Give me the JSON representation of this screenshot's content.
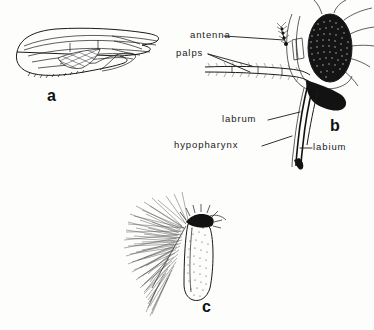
{
  "plate": {
    "title": "Mosquito morphology plate",
    "background_color": "#fdfdfc",
    "ink_color": "#1a1a1a",
    "width": 374,
    "height": 330
  },
  "figures": [
    {
      "id": "a",
      "letter": "a",
      "subject": "mosquito wing",
      "description": "Lateral outline of a mosquito wing showing longitudinal veins, a cross-hatched shaded cell, and a fringed posterior margin."
    },
    {
      "id": "b",
      "letter": "b",
      "subject": "mosquito head in lateral view",
      "description": "Head with large stippled compound eye, segmented antenna, hairy maxillary palps, and the elongated proboscis stylet bundle."
    },
    {
      "id": "c",
      "letter": "c",
      "subject": "plumose antenna segment",
      "description": "Stippled antennal capsule bearing a dense plume of radiating hairs and a spiky crown."
    }
  ],
  "labels": [
    {
      "id": "antenna",
      "text": "antenna"
    },
    {
      "id": "palps",
      "text": "palps"
    },
    {
      "id": "labrum",
      "text": "labrum"
    },
    {
      "id": "hypopharynx",
      "text": "hypopharynx"
    },
    {
      "id": "labium",
      "text": "labium"
    }
  ]
}
